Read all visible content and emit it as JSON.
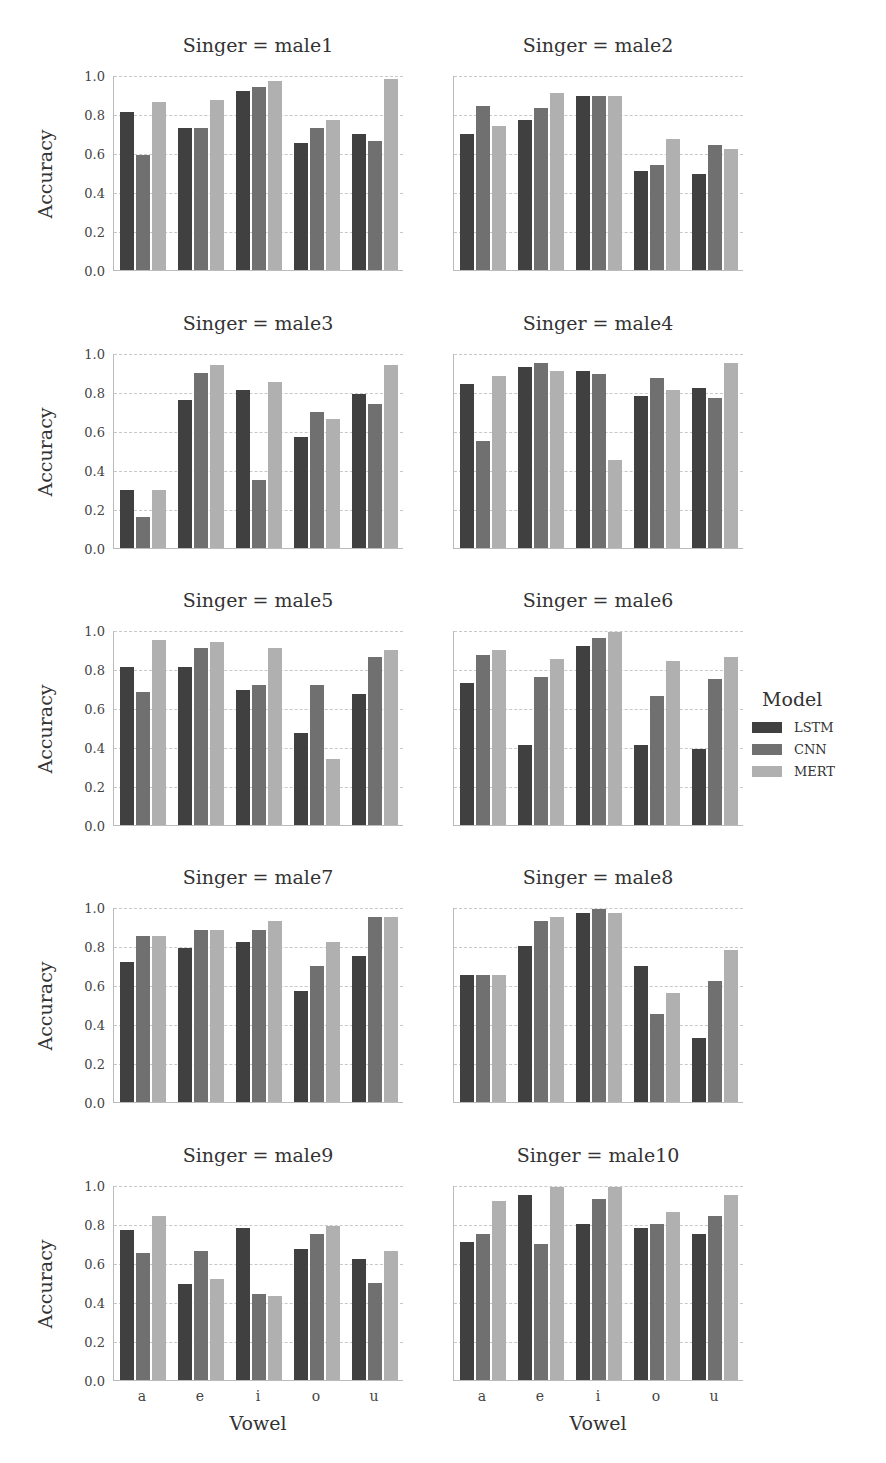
{
  "chart_data": {
    "type": "bar",
    "layout": "faceted grid 5 rows x 2 cols",
    "categories": [
      "a",
      "e",
      "i",
      "o",
      "u"
    ],
    "xlabel": "Vowel",
    "ylabel": "Accuracy",
    "ylim": [
      0.0,
      1.0
    ],
    "yticks": [
      "0.0",
      "0.2",
      "0.4",
      "0.6",
      "0.8",
      "1.0"
    ],
    "grid": true,
    "legend": {
      "title": "Model",
      "position": "right",
      "entries": [
        {
          "name": "LSTM",
          "color": "#404040"
        },
        {
          "name": "CNN",
          "color": "#707070"
        },
        {
          "name": "MERT",
          "color": "#b0b0b0"
        }
      ]
    },
    "panels": [
      {
        "title": "Singer = male1",
        "series": [
          {
            "name": "LSTM",
            "values": [
              0.81,
              0.73,
              0.92,
              0.65,
              0.7
            ]
          },
          {
            "name": "CNN",
            "values": [
              0.59,
              0.73,
              0.94,
              0.73,
              0.66
            ]
          },
          {
            "name": "MERT",
            "values": [
              0.86,
              0.87,
              0.97,
              0.77,
              0.98
            ]
          }
        ]
      },
      {
        "title": "Singer = male2",
        "series": [
          {
            "name": "LSTM",
            "values": [
              0.7,
              0.77,
              0.89,
              0.51,
              0.49
            ]
          },
          {
            "name": "CNN",
            "values": [
              0.84,
              0.83,
              0.89,
              0.54,
              0.64
            ]
          },
          {
            "name": "MERT",
            "values": [
              0.74,
              0.91,
              0.89,
              0.67,
              0.62
            ]
          }
        ]
      },
      {
        "title": "Singer = male3",
        "series": [
          {
            "name": "LSTM",
            "values": [
              0.3,
              0.76,
              0.81,
              0.57,
              0.79
            ]
          },
          {
            "name": "CNN",
            "values": [
              0.16,
              0.9,
              0.35,
              0.7,
              0.74
            ]
          },
          {
            "name": "MERT",
            "values": [
              0.3,
              0.94,
              0.85,
              0.66,
              0.94
            ]
          }
        ]
      },
      {
        "title": "Singer = male4",
        "series": [
          {
            "name": "LSTM",
            "values": [
              0.84,
              0.93,
              0.91,
              0.78,
              0.82
            ]
          },
          {
            "name": "CNN",
            "values": [
              0.55,
              0.95,
              0.89,
              0.87,
              0.77
            ]
          },
          {
            "name": "MERT",
            "values": [
              0.88,
              0.91,
              0.45,
              0.81,
              0.95
            ]
          }
        ]
      },
      {
        "title": "Singer = male5",
        "series": [
          {
            "name": "LSTM",
            "values": [
              0.81,
              0.81,
              0.69,
              0.47,
              0.67
            ]
          },
          {
            "name": "CNN",
            "values": [
              0.68,
              0.91,
              0.72,
              0.72,
              0.86
            ]
          },
          {
            "name": "MERT",
            "values": [
              0.95,
              0.94,
              0.91,
              0.34,
              0.9
            ]
          }
        ]
      },
      {
        "title": "Singer = male6",
        "series": [
          {
            "name": "LSTM",
            "values": [
              0.73,
              0.41,
              0.92,
              0.41,
              0.39
            ]
          },
          {
            "name": "CNN",
            "values": [
              0.87,
              0.76,
              0.96,
              0.66,
              0.75
            ]
          },
          {
            "name": "MERT",
            "values": [
              0.9,
              0.85,
              0.99,
              0.84,
              0.86
            ]
          }
        ]
      },
      {
        "title": "Singer = male7",
        "series": [
          {
            "name": "LSTM",
            "values": [
              0.72,
              0.79,
              0.82,
              0.57,
              0.75
            ]
          },
          {
            "name": "CNN",
            "values": [
              0.85,
              0.88,
              0.88,
              0.7,
              0.95
            ]
          },
          {
            "name": "MERT",
            "values": [
              0.85,
              0.88,
              0.93,
              0.82,
              0.95
            ]
          }
        ]
      },
      {
        "title": "Singer = male8",
        "series": [
          {
            "name": "LSTM",
            "values": [
              0.65,
              0.8,
              0.97,
              0.7,
              0.33
            ]
          },
          {
            "name": "CNN",
            "values": [
              0.65,
              0.93,
              0.99,
              0.45,
              0.62
            ]
          },
          {
            "name": "MERT",
            "values": [
              0.65,
              0.95,
              0.97,
              0.56,
              0.78
            ]
          }
        ]
      },
      {
        "title": "Singer = male9",
        "series": [
          {
            "name": "LSTM",
            "values": [
              0.77,
              0.49,
              0.78,
              0.67,
              0.62
            ]
          },
          {
            "name": "CNN",
            "values": [
              0.65,
              0.66,
              0.44,
              0.75,
              0.5
            ]
          },
          {
            "name": "MERT",
            "values": [
              0.84,
              0.52,
              0.43,
              0.79,
              0.66
            ]
          }
        ]
      },
      {
        "title": "Singer = male10",
        "series": [
          {
            "name": "LSTM",
            "values": [
              0.71,
              0.95,
              0.8,
              0.78,
              0.75
            ]
          },
          {
            "name": "CNN",
            "values": [
              0.75,
              0.7,
              0.93,
              0.8,
              0.84
            ]
          },
          {
            "name": "MERT",
            "values": [
              0.92,
              0.99,
              0.99,
              0.86,
              0.95
            ]
          }
        ]
      }
    ]
  }
}
